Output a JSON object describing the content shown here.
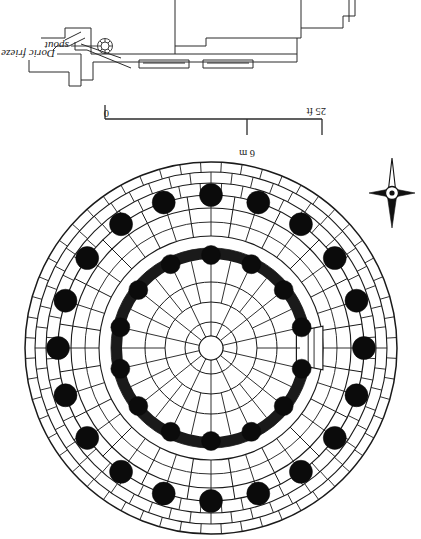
{
  "figure": {
    "kind": "archaeological-plan",
    "orientation_note": "scan is inverted 180 degrees",
    "background_color": "#ffffff",
    "ink_color": "#1a1a1a"
  },
  "section_detail": {
    "name": "entablature-cornice-section",
    "labels": [
      {
        "id": "doric-frieze",
        "text": "Doric frieze",
        "clipped_text": "oric frieze"
      },
      {
        "id": "spout",
        "text": "spout",
        "clipped_text": "out"
      }
    ]
  },
  "scale_bar": {
    "name": "graphic-scale",
    "left_label": "25 ft",
    "right_label": "0",
    "metric_label": "6 m",
    "units": [
      "ft",
      "m"
    ],
    "feet_max": 25,
    "meters_max": 6
  },
  "north_arrow": {
    "name": "north-arrow",
    "label": ""
  },
  "plan": {
    "name": "tholos-plan",
    "center": {
      "x": 189,
      "y": 189
    },
    "outer_peristyle_columns": 20,
    "inner_cella_columns": 14,
    "rings": [
      {
        "id": "krepis-outer",
        "radius": 186,
        "role": "outer step edge"
      },
      {
        "id": "krepis-mid",
        "radius": 176,
        "role": "step course"
      },
      {
        "id": "krepis-inner",
        "radius": 165,
        "role": "step course"
      },
      {
        "id": "stylobate",
        "radius": 153,
        "role": "stylobate"
      },
      {
        "id": "paving-outer",
        "radius": 140,
        "role": "peristyle paving"
      },
      {
        "id": "paving-inner",
        "radius": 112,
        "role": "peristyle paving"
      },
      {
        "id": "cella-outer",
        "radius": 100,
        "role": "cella wall outer face"
      },
      {
        "id": "cella-inner",
        "radius": 89,
        "role": "cella wall inner face"
      },
      {
        "id": "floor-ring-1",
        "radius": 66,
        "role": "interior paving ring"
      },
      {
        "id": "floor-ring-2",
        "radius": 46,
        "role": "interior paving ring"
      },
      {
        "id": "floor-ring-3",
        "radius": 26,
        "role": "interior paving ring"
      },
      {
        "id": "omphalos",
        "radius": 12,
        "role": "central disc"
      }
    ],
    "column_rings": [
      {
        "id": "peristyle-columns",
        "count": 20,
        "radius": 153,
        "column_radius": 11.5
      },
      {
        "id": "cella-columns",
        "count": 14,
        "radius": 93,
        "column_radius": 9.5
      }
    ],
    "entrance": {
      "id": "cella-doorway",
      "bearing_deg": 270,
      "width_deg": 22
    }
  }
}
